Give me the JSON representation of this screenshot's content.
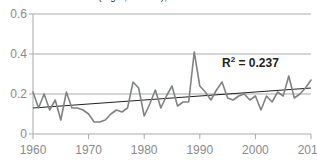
{
  "chart_data": {
    "type": "line",
    "title": "(mg/L, annual), 1960-2010",
    "xlabel": "",
    "ylabel": "",
    "xlim": [
      1960,
      2010
    ],
    "ylim": [
      0,
      0.6
    ],
    "xticks": [
      1960,
      1970,
      1980,
      1990,
      2000,
      2010
    ],
    "yticks": [
      0,
      0.2,
      0.4,
      0.6
    ],
    "ytick_labels": [
      "0",
      "0.2",
      "0.4",
      "0.6"
    ],
    "xtick_labels": [
      "1960",
      "1970",
      "1980",
      "1990",
      "2000",
      "2010"
    ],
    "grid": "horizontal",
    "legend": "none",
    "series": [
      {
        "name": "annual value",
        "color": "#808285",
        "x": [
          1960,
          1961,
          1962,
          1963,
          1964,
          1965,
          1966,
          1967,
          1968,
          1969,
          1970,
          1971,
          1972,
          1973,
          1974,
          1975,
          1976,
          1977,
          1978,
          1979,
          1980,
          1981,
          1982,
          1983,
          1984,
          1985,
          1986,
          1987,
          1988,
          1989,
          1990,
          1991,
          1992,
          1993,
          1994,
          1995,
          1996,
          1997,
          1998,
          1999,
          2000,
          2001,
          2002,
          2003,
          2004,
          2005,
          2006,
          2007,
          2008,
          2009,
          2010
        ],
        "values": [
          0.21,
          0.13,
          0.2,
          0.12,
          0.17,
          0.07,
          0.21,
          0.13,
          0.13,
          0.12,
          0.1,
          0.06,
          0.06,
          0.07,
          0.1,
          0.12,
          0.11,
          0.13,
          0.26,
          0.23,
          0.09,
          0.15,
          0.22,
          0.13,
          0.19,
          0.24,
          0.14,
          0.16,
          0.16,
          0.41,
          0.24,
          0.21,
          0.17,
          0.22,
          0.26,
          0.18,
          0.17,
          0.19,
          0.2,
          0.17,
          0.19,
          0.12,
          0.19,
          0.16,
          0.21,
          0.19,
          0.29,
          0.18,
          0.2,
          0.23,
          0.27
        ]
      }
    ],
    "trendline": {
      "name": "linear trend",
      "color": "#231f20",
      "x": [
        1960,
        2010
      ],
      "values": [
        0.13,
        0.23
      ],
      "annotation": "R² = 0.237",
      "r_squared": 0.237
    }
  },
  "annotation": {
    "r2_prefix": "R",
    "r2_exponent": "2",
    "r2_value": " = 0.237"
  }
}
